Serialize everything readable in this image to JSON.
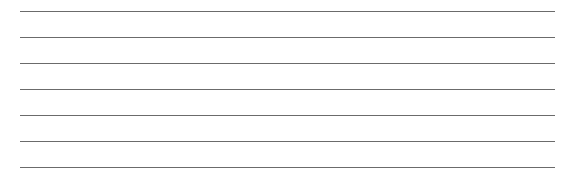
{
  "ruled_lines": {
    "count": 7,
    "color": "#6b6b6b",
    "positions_y": [
      11,
      37,
      63,
      89,
      115,
      141,
      167
    ]
  }
}
